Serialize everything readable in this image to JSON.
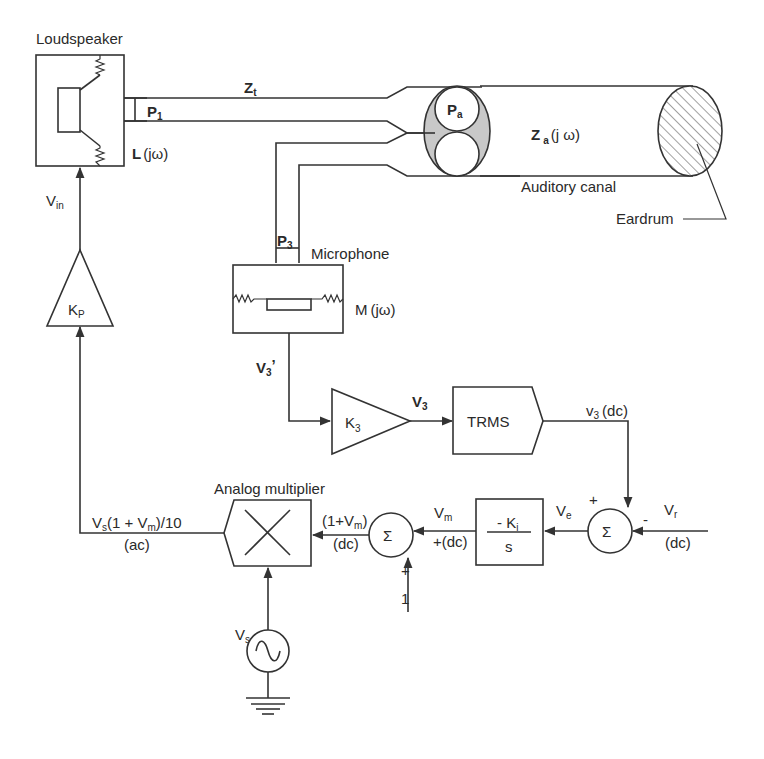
{
  "diagram": {
    "colors": {
      "line": "#333333",
      "text": "#2a2a2a",
      "shaded": "#c8c8c8",
      "background": "#ffffff"
    },
    "components": {
      "loudspeaker": {
        "label": "Loudspeaker",
        "transfer": "L",
        "transfer_arg": "(jω)"
      },
      "tube_speaker": {
        "impedance": "Z",
        "impedance_sub": "t",
        "pressure": "P",
        "pressure_sub": "1"
      },
      "probe_junction": {
        "pressure": "P",
        "pressure_sub": "a"
      },
      "auditory_canal": {
        "label": "Auditory canal",
        "impedance": "Z",
        "impedance_sub": "a",
        "impedance_arg": "(j ω)"
      },
      "eardrum": {
        "label": "Eardrum"
      },
      "microphone": {
        "label": "Microphone",
        "transfer": "M",
        "transfer_arg": "(jω)",
        "pressure": "P",
        "pressure_sub": "3"
      },
      "mic_output": {
        "signal": "V",
        "signal_sub": "3",
        "signal_prime": "’"
      },
      "amp_k3": {
        "gain": "K",
        "gain_sub": "3"
      },
      "amp_k3_output": {
        "signal": "V",
        "signal_sub": "3"
      },
      "trms": {
        "label": "TRMS"
      },
      "trms_output": {
        "signal": "v",
        "signal_sub": "3",
        "note": "(dc)"
      },
      "sum_error": {
        "symbol": "Σ",
        "plus": "+",
        "minus": "-"
      },
      "reference": {
        "signal": "V",
        "signal_sub": "r",
        "note": "(dc)"
      },
      "error_signal": {
        "signal": "V",
        "signal_sub": "e"
      },
      "integrator": {
        "numerator": "- K",
        "numerator_sub": "i",
        "denominator": "s"
      },
      "integrator_output": {
        "signal": "V",
        "signal_sub": "m",
        "note": "(dc)",
        "plus": "+"
      },
      "sum_offset": {
        "symbol": "Σ",
        "plus": "+",
        "constant": "1"
      },
      "offset_output": {
        "signal": "(1+V",
        "signal_sub": "m",
        "signal_close": ")",
        "note": "(dc)"
      },
      "multiplier": {
        "label": "Analog multiplier"
      },
      "source": {
        "signal": "V",
        "signal_sub": "s"
      },
      "multiplier_output": {
        "signal": "V",
        "signal_sub": "s",
        "expr": "(1 + V",
        "expr_sub": "m",
        "expr_close": ")/10",
        "note": "(ac)"
      },
      "amp_kp": {
        "gain": "K",
        "gain_sub": "P"
      },
      "amp_kp_output": {
        "signal": "V",
        "signal_sub": "in"
      }
    }
  }
}
